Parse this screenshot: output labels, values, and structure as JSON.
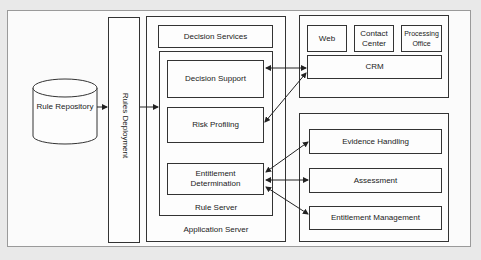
{
  "diagram": {
    "type": "architecture",
    "nodes": {
      "rule_repository": "Rule Repository",
      "rules_deployment": "Rules Deployment",
      "application_server": "Application Server",
      "decision_services": "Decision Services",
      "rule_server": "Rule Server",
      "decision_support": "Decision Support",
      "risk_profiling": "Risk Profiling",
      "entitlement_determination_line1": "Entitlement",
      "entitlement_determination_line2": "Determination",
      "web": "Web",
      "contact_center_line1": "Contact",
      "contact_center_line2": "Center",
      "processing_office_line1": "Processing",
      "processing_office_line2": "Office",
      "crm": "CRM",
      "evidence_handling": "Evidence Handling",
      "assessment": "Assessment",
      "entitlement_management": "Entitlement Management"
    },
    "edges": [
      {
        "from": "Rule Repository",
        "to": "Rules Deployment",
        "direction": "one-way"
      },
      {
        "from": "Rules Deployment",
        "to": "Rule Server",
        "direction": "one-way"
      },
      {
        "from": "Decision Support",
        "to": "CRM",
        "direction": "two-way"
      },
      {
        "from": "Risk Profiling",
        "to": "CRM",
        "direction": "two-way"
      },
      {
        "from": "Entitlement Determination",
        "to": "Evidence Handling",
        "direction": "two-way"
      },
      {
        "from": "Entitlement Determination",
        "to": "Assessment",
        "direction": "two-way"
      },
      {
        "from": "Entitlement Determination",
        "to": "Entitlement Management",
        "direction": "two-way"
      }
    ],
    "colors": {
      "background": "#e9e9e9",
      "canvas": "#fbfbfb",
      "stroke": "#333333"
    }
  }
}
